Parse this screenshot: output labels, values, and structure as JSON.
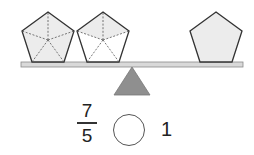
{
  "diagram": {
    "type": "balance-scale-fraction-comparison",
    "left_pan": {
      "shapes": [
        {
          "shape": "pentagon",
          "parts": 5,
          "shaded_parts": 5,
          "label": "whole pentagon divided into 5 parts, all shaded"
        },
        {
          "shape": "pentagon",
          "parts": 5,
          "shaded_parts": 2,
          "label": "pentagon divided into 5 parts, 2 shaded"
        }
      ]
    },
    "right_pan": {
      "shapes": [
        {
          "shape": "pentagon",
          "parts": 1,
          "shaded_parts": 1,
          "label": "whole pentagon"
        }
      ]
    },
    "fulcrum": "triangle",
    "colors": {
      "shape_fill": "#ececec",
      "outline": "#333333",
      "beam": "#d9d9d9",
      "fulcrum": "#8f8f8f",
      "dashed_lines": "#555555"
    }
  },
  "question": {
    "left_fraction": {
      "numerator": "7",
      "denominator": "5"
    },
    "comparison_blank": "",
    "right_value": "1"
  }
}
